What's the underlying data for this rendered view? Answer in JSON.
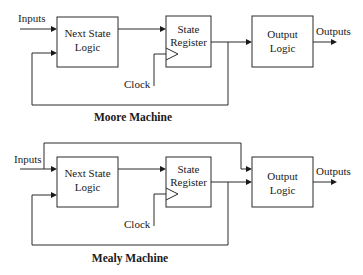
{
  "moore": {
    "caption": "Moore Machine",
    "inputs_label": "Inputs",
    "outputs_label": "Outputs",
    "clock_label": "Clock",
    "next_state_logic": {
      "line1": "Next State",
      "line2": "Logic"
    },
    "state_register": {
      "line1": "State",
      "line2": "Register"
    },
    "output_logic": {
      "line1": "Output",
      "line2": "Logic"
    }
  },
  "mealy": {
    "caption": "Mealy Machine",
    "inputs_label": "Inputs",
    "outputs_label": "Outputs",
    "clock_label": "Clock",
    "next_state_logic": {
      "line1": "Next State",
      "line2": "Logic"
    },
    "state_register": {
      "line1": "State",
      "line2": "Register"
    },
    "output_logic": {
      "line1": "Output",
      "line2": "Logic"
    }
  },
  "colors": {
    "stroke": "#2a2a2a",
    "text": "#1a1a1a",
    "background": "#ffffff"
  }
}
